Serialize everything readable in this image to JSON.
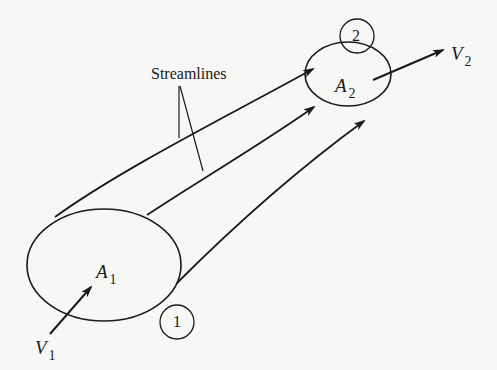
{
  "diagram": {
    "type": "fluid-flow stream tube",
    "labels": {
      "streamlines": "Streamlines",
      "area_inlet": {
        "symbol": "A",
        "subscript": "1"
      },
      "area_outlet": {
        "symbol": "A",
        "subscript": "2"
      },
      "velocity_inlet": {
        "symbol": "V",
        "subscript": "1"
      },
      "velocity_outlet": {
        "symbol": "V",
        "subscript": "2"
      },
      "section_inlet": "1",
      "section_outlet": "2"
    },
    "colors": {
      "background": "#f7f7f5",
      "ink": "#1a1a1a"
    }
  }
}
